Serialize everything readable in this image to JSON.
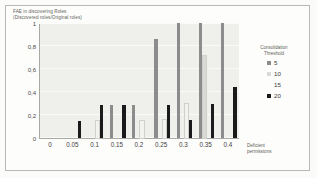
{
  "chart_data": {
    "type": "bar",
    "title": [
      "FAE in discovering Roles",
      "(Discovered roles/Original roles)"
    ],
    "xlabel": [
      "Deficient",
      "permissions"
    ],
    "ylabel": "",
    "legend_title": [
      "Consolidation",
      "Threshold"
    ],
    "legend_position": "right",
    "grid": true,
    "ylim": [
      0,
      1
    ],
    "yticks": [
      "1",
      "0,8",
      "0,6",
      "0,4",
      "0,2",
      "0"
    ],
    "ytick_values": [
      1,
      0.8,
      0.6,
      0.4,
      0.2,
      0
    ],
    "categories": [
      "0",
      "0.05",
      "0.1",
      "0.15",
      "0.2",
      "0.25",
      "0.3",
      "0.35",
      "0.4"
    ],
    "series": [
      {
        "name": "5",
        "color": "#8c8c8c",
        "values": [
          0,
          0,
          0,
          0.29,
          0.29,
          0.86,
          1.0,
          1.0,
          1.0
        ]
      },
      {
        "name": "10",
        "color": "#d9d9d6",
        "values": [
          0,
          0,
          0,
          0,
          0,
          0,
          0,
          0.71,
          0
        ]
      },
      {
        "name": "15",
        "color": "#f2f2ef",
        "values": [
          0,
          0,
          0.15,
          0,
          0.15,
          0.16,
          0.3,
          0,
          0
        ]
      },
      {
        "name": "20",
        "color": "#1a1a1a",
        "values": [
          0,
          0.15,
          0.29,
          0.29,
          0,
          0.29,
          0.155,
          0.3,
          0.44
        ]
      }
    ]
  },
  "colors": {
    "plot_background": "#efefec",
    "frame_border": "#b9b9b4",
    "axis": "#a9a9a4",
    "gridline": "#fafaf8"
  }
}
